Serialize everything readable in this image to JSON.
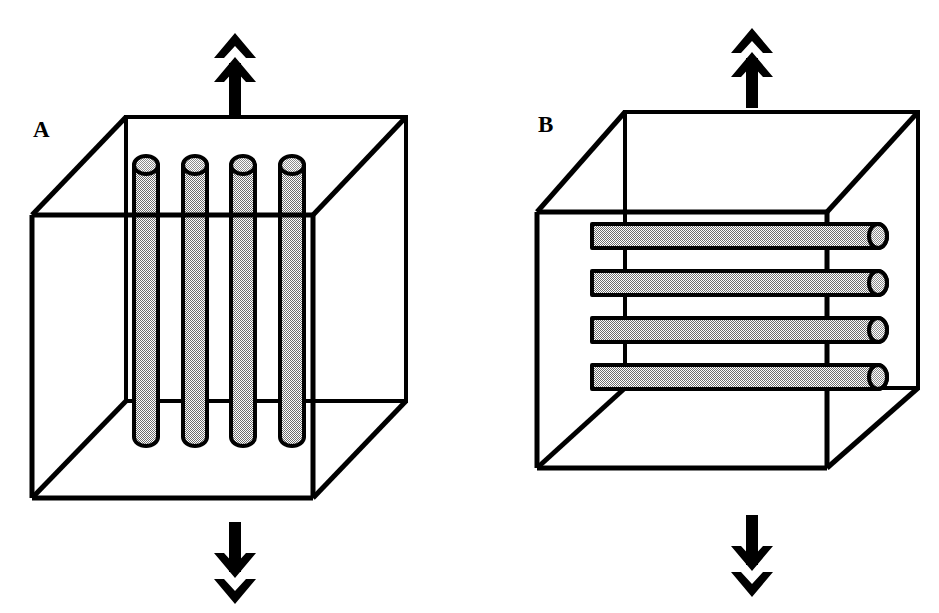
{
  "figure": {
    "background_color": "#ffffff",
    "line_color": "#000000",
    "fiber_fill_color": "#b4b4b4",
    "fiber_outline_color": "#000000",
    "arrow_color": "#000000"
  },
  "panels": [
    {
      "id": "panel-a",
      "label": "A",
      "label_x": 33,
      "label_y": 137,
      "description": "Cube containing four vertical fibers aligned parallel to the loading direction",
      "fiber_orientation": "parallel-to-load",
      "fiber_count": 4,
      "cube": {
        "front_top_left": [
          32,
          215
        ],
        "front_top_right": [
          313,
          215
        ],
        "front_bottom_left": [
          32,
          498
        ],
        "front_bottom_right": [
          313,
          498
        ],
        "back_top_left": [
          126,
          117
        ],
        "back_top_right": [
          406,
          117
        ],
        "back_bottom_left": [
          126,
          401
        ],
        "back_bottom_right": [
          406,
          401
        ]
      },
      "fibers": [
        {
          "cx": 146,
          "top": 155,
          "bottom": 446,
          "width": 24
        },
        {
          "cx": 195,
          "top": 155,
          "bottom": 446,
          "width": 24
        },
        {
          "cx": 243,
          "top": 155,
          "bottom": 446,
          "width": 24
        },
        {
          "cx": 292,
          "top": 155,
          "bottom": 446,
          "width": 24
        }
      ],
      "arrow_top": {
        "name": "load-arrow-up",
        "direction": "up",
        "x": 235,
        "tail_y": 113,
        "head_y": 33,
        "chevrons": 2
      },
      "arrow_bottom": {
        "name": "load-arrow-down",
        "direction": "down",
        "x": 235,
        "tail_y": 522,
        "head_y": 602,
        "chevrons": 2
      }
    },
    {
      "id": "panel-b",
      "label": "B",
      "label_x": 538,
      "label_y": 132,
      "description": "Cube containing four horizontal fibers aligned perpendicular to the loading direction",
      "fiber_orientation": "perpendicular-to-load",
      "fiber_count": 4,
      "cube": {
        "front_top_left": [
          537,
          212
        ],
        "front_top_right": [
          827,
          212
        ],
        "front_bottom_left": [
          537,
          468
        ],
        "front_bottom_right": [
          827,
          468
        ],
        "back_top_left": [
          625,
          112
        ],
        "back_top_right": [
          918,
          112
        ],
        "back_bottom_left": [
          625,
          388
        ],
        "back_bottom_right": [
          918,
          388
        ]
      },
      "fibers": [
        {
          "cy": 236,
          "left": 584,
          "right": 890,
          "height": 24
        },
        {
          "cy": 283,
          "left": 584,
          "right": 890,
          "height": 24
        },
        {
          "cy": 330,
          "left": 584,
          "right": 890,
          "height": 24
        },
        {
          "cy": 377,
          "left": 584,
          "right": 890,
          "height": 24
        }
      ],
      "arrow_top": {
        "name": "load-arrow-up",
        "direction": "up",
        "x": 752,
        "tail_y": 105,
        "head_y": 28,
        "chevrons": 2
      },
      "arrow_bottom": {
        "name": "load-arrow-down",
        "direction": "down",
        "x": 752,
        "tail_y": 515,
        "head_y": 595,
        "chevrons": 2
      }
    }
  ]
}
